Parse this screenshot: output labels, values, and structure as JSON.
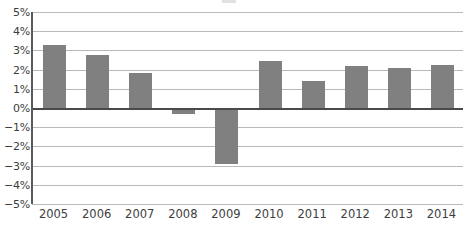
{
  "chart_data": {
    "type": "bar",
    "title": "",
    "xlabel": "",
    "ylabel": "",
    "categories": [
      "2005",
      "2006",
      "2007",
      "2008",
      "2009",
      "2010",
      "2011",
      "2012",
      "2013",
      "2014"
    ],
    "values": [
      3.3,
      2.75,
      1.8,
      -0.3,
      -2.9,
      2.45,
      1.4,
      2.2,
      2.1,
      2.25
    ],
    "value_labels": [
      "3.3%",
      "2.75%",
      "1.8%",
      "-0.3%",
      "-2.9%",
      "2.45%",
      "1.4%",
      "2.2%",
      "2.1%",
      "2.25%"
    ],
    "ylim": [
      -5,
      5
    ],
    "ytick_values": [
      5,
      4,
      3,
      2,
      1,
      0,
      -1,
      -2,
      -3,
      -4,
      -5
    ],
    "ytick_labels": [
      "5%",
      "4%",
      "3%",
      "2%",
      "1%",
      "0%",
      "−1%",
      "−2%",
      "−3%",
      "−4%",
      "−5%"
    ],
    "grid": true,
    "legend": null,
    "series_color": "#808080",
    "gridline_color": "#b9b9b9",
    "axis_color": "#4a4a4a",
    "bar_count": 10
  }
}
